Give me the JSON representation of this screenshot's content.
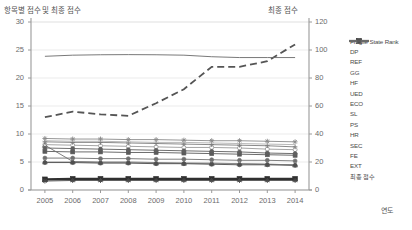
{
  "titles": {
    "left_axis_title": "항목별 점수 및 최종 점수",
    "right_axis_title": "최종 점수",
    "x_axis_title": "연도"
  },
  "chart_data": {
    "type": "line",
    "title": "항목별 점수 및 최종 점수",
    "xlabel": "연도",
    "ylabel": "항목별 점수 및 최종 점수",
    "y2label": "최종 점수",
    "grid": true,
    "legend_position": "right",
    "categories": [
      "2005",
      "2006",
      "2007",
      "2008",
      "2009",
      "2010",
      "2011",
      "2012",
      "2013",
      "2014"
    ],
    "x_ticks": [
      "2005",
      "2006",
      "2007",
      "2008",
      "2009",
      "2010",
      "2011",
      "2012",
      "2013",
      "2014"
    ],
    "y_ticks": [
      0,
      5,
      10,
      15,
      20,
      25,
      30
    ],
    "ylim": [
      0,
      30
    ],
    "y2_ticks": [
      0,
      20,
      40,
      60,
      80,
      100,
      120
    ],
    "y2lim": [
      0,
      120
    ],
    "series": [
      {
        "name": "Fragile State Rank",
        "axis": "right",
        "style": "dashed",
        "marker": "none",
        "color": "#555555",
        "values": [
          52,
          56,
          54,
          53,
          62,
          72,
          88,
          88,
          92,
          104
        ]
      },
      {
        "name": "DP",
        "axis": "left",
        "style": "solid",
        "marker": "circle-open",
        "color": "#9a9a9a",
        "values": [
          8.1,
          8.0,
          7.9,
          7.8,
          7.7,
          7.6,
          7.6,
          7.5,
          7.3,
          7.2
        ]
      },
      {
        "name": "REF",
        "axis": "left",
        "style": "solid",
        "marker": "plus",
        "color": "#7c7c7c",
        "values": [
          8.6,
          8.5,
          8.5,
          8.4,
          8.3,
          8.2,
          8.1,
          8.0,
          7.9,
          7.7
        ]
      },
      {
        "name": "GG",
        "axis": "left",
        "style": "solid",
        "marker": "square",
        "color": "#5a5a5a",
        "values": [
          6.9,
          6.8,
          6.8,
          6.7,
          6.7,
          6.6,
          6.5,
          6.4,
          6.3,
          6.2
        ]
      },
      {
        "name": "HF",
        "axis": "left",
        "style": "solid",
        "marker": "triangle-open",
        "color": "#6f6f6f",
        "values": [
          8.0,
          5.1,
          5.0,
          5.0,
          4.9,
          4.8,
          4.8,
          4.7,
          4.6,
          4.5
        ]
      },
      {
        "name": "UED",
        "axis": "left",
        "style": "solid",
        "marker": "star",
        "color": "#8a8a8a",
        "values": [
          9.2,
          9.1,
          9.1,
          9.0,
          9.0,
          8.9,
          8.8,
          8.8,
          8.7,
          8.6
        ]
      },
      {
        "name": "ECO",
        "axis": "left",
        "style": "solid",
        "marker": "circle-filled",
        "color": "#707070",
        "values": [
          5.7,
          5.7,
          5.6,
          5.6,
          5.5,
          5.5,
          5.4,
          5.3,
          5.3,
          5.2
        ]
      },
      {
        "name": "SL",
        "axis": "left",
        "style": "solid",
        "marker": "square-filled",
        "color": "#303030",
        "values": [
          1.9,
          2.0,
          2.0,
          2.0,
          2.0,
          2.0,
          2.0,
          2.0,
          2.0,
          2.0
        ]
      },
      {
        "name": "PS",
        "axis": "left",
        "style": "solid",
        "marker": "star",
        "color": "#4a4a4a",
        "values": [
          1.6,
          1.7,
          1.7,
          1.7,
          1.7,
          1.7,
          1.7,
          1.7,
          1.7,
          1.7
        ]
      },
      {
        "name": "HR",
        "axis": "left",
        "style": "solid",
        "marker": "triangle-open",
        "color": "#8d8d8d",
        "values": [
          5.0,
          5.0,
          4.9,
          4.9,
          4.8,
          4.8,
          4.7,
          4.7,
          4.6,
          4.5
        ]
      },
      {
        "name": "SEC",
        "axis": "left",
        "style": "solid",
        "marker": "circle-filled",
        "color": "#5f5f5f",
        "values": [
          7.5,
          7.4,
          7.3,
          7.2,
          7.1,
          7.0,
          6.9,
          6.8,
          6.6,
          6.5
        ]
      },
      {
        "name": "FE",
        "axis": "left",
        "style": "solid",
        "marker": "none",
        "color": "#b0b0b0",
        "values": [
          8.8,
          8.7,
          8.7,
          8.6,
          8.5,
          8.5,
          8.4,
          8.3,
          8.2,
          8.1
        ]
      },
      {
        "name": "EXT",
        "axis": "left",
        "style": "solid",
        "marker": "circle-filled",
        "color": "#4f4f4f",
        "values": [
          4.9,
          4.9,
          4.8,
          4.8,
          4.7,
          4.7,
          4.6,
          4.5,
          4.5,
          4.4
        ]
      },
      {
        "name": "최종 점수",
        "axis": "right",
        "style": "solid",
        "marker": "none",
        "color": "#6a6a6a",
        "values": [
          95.5,
          96.3,
          96.6,
          96.7,
          96.6,
          96.3,
          95.2,
          94.6,
          94.6,
          94.6
        ]
      }
    ]
  },
  "legend": {
    "items": [
      {
        "label": "Fragile State Rank"
      },
      {
        "label": "DP"
      },
      {
        "label": "REF"
      },
      {
        "label": "GG"
      },
      {
        "label": "HF"
      },
      {
        "label": "UED"
      },
      {
        "label": "ECO"
      },
      {
        "label": "SL"
      },
      {
        "label": "PS"
      },
      {
        "label": "HR"
      },
      {
        "label": "SEC"
      },
      {
        "label": "FE"
      },
      {
        "label": "EXT"
      },
      {
        "label": "최종 점수"
      }
    ]
  },
  "colors": {
    "plot_border": "#d9d9d9",
    "gridline": "#e6e6e6",
    "axis": "#9a9a9a",
    "text": "#5a5a5a"
  }
}
